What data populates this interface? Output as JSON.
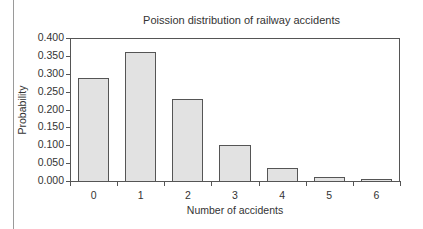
{
  "chart_data": {
    "type": "bar",
    "title": "Poission distribution of railway accidents",
    "xlabel": "Number of accidents",
    "ylabel": "Probability",
    "categories": [
      "0",
      "1",
      "2",
      "3",
      "4",
      "5",
      "6"
    ],
    "values": [
      0.288,
      0.361,
      0.23,
      0.1,
      0.035,
      0.012,
      0.005
    ],
    "ylim": [
      0,
      0.4
    ],
    "yticks": [
      "0.000",
      "0.050",
      "0.100",
      "0.150",
      "0.200",
      "0.250",
      "0.300",
      "0.350",
      "0.400"
    ],
    "grid": false,
    "legend": null,
    "bar_color": "#e2e2e2",
    "edge_color": "#555555"
  }
}
